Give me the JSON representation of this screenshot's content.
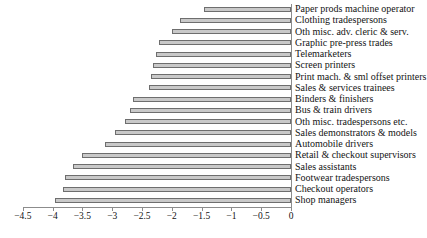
{
  "chart_data": {
    "type": "bar",
    "orientation": "horizontal",
    "title": "",
    "xlabel": "",
    "ylabel": "",
    "xlim": [
      -4.5,
      0
    ],
    "grid": false,
    "legend": null,
    "xticks": [
      -4.5,
      -4,
      -3.5,
      -3,
      -2.5,
      -2,
      -1.5,
      -1,
      -0.5,
      0
    ],
    "xticklabels": [
      "−4.5",
      "−4",
      "−3.5",
      "−3",
      "−2.5",
      "−2",
      "−1.5",
      "−1",
      "−0.5",
      "0"
    ],
    "categories": [
      "Paper prods machine operator",
      "Clothing tradespersons",
      "Oth misc. adv. cleric & serv.",
      "Graphic pre-press trades",
      "Telemarketers",
      "Screen printers",
      "Print mach. & sml offset printers",
      "Sales & services trainees",
      "Binders & finishers",
      "Bus & train drivers",
      "Oth misc. tradespersons etc.",
      "Sales demonstrators & models",
      "Automobile drivers",
      "Retail & checkout supervisors",
      "Sales assistants",
      "Footwear tradespersons",
      "Checkout operators",
      "Shop managers"
    ],
    "values": [
      -1.46,
      -1.87,
      -1.99,
      -2.22,
      -2.27,
      -2.32,
      -2.35,
      -2.39,
      -2.65,
      -2.7,
      -2.79,
      -2.95,
      -3.12,
      -3.5,
      -3.65,
      -3.8,
      -3.82,
      -3.96
    ],
    "bar_color": "#c9c9c9",
    "bar_edge_color": "#6e6e6e",
    "axis_color": "#8c8c8c"
  }
}
